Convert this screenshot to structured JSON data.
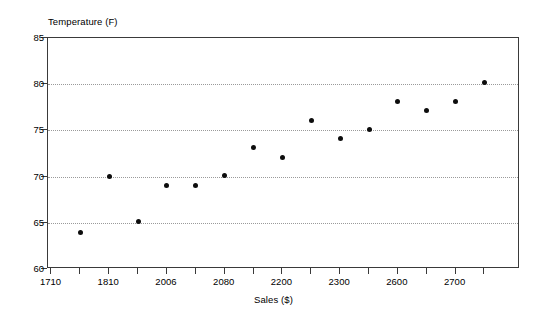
{
  "chart_data": {
    "type": "scatter",
    "title": "",
    "xlabel": "Sales ($)",
    "ylabel": "Temperature (F)",
    "ylim": [
      60,
      85
    ],
    "y_ticks": [
      60,
      65,
      70,
      75,
      80,
      85
    ],
    "grid": "horizontal-dotted",
    "legend": "none",
    "x_tick_labels": [
      "1710",
      "",
      "1810",
      "",
      "2006",
      "",
      "2080",
      "",
      "2200",
      "",
      "2300",
      "",
      "2600",
      "",
      "2700",
      ""
    ],
    "x_categories": [
      "1710",
      "1760",
      "1810",
      "1910",
      "2006",
      "2050",
      "2080",
      "2150",
      "2200",
      "2250",
      "2300",
      "2450",
      "2600",
      "2650",
      "2700"
    ],
    "points": [
      {
        "x_label": "1710",
        "x_index": 1,
        "y": 64.0
      },
      {
        "x_label": "1760",
        "x_index": 2,
        "y": 70.0
      },
      {
        "x_label": "1810",
        "x_index": 3,
        "y": 65.1
      },
      {
        "x_label": "1910",
        "x_index": 4,
        "y": 69.0
      },
      {
        "x_label": "2006",
        "x_index": 5,
        "y": 69.0
      },
      {
        "x_label": "2050",
        "x_index": 6,
        "y": 70.1
      },
      {
        "x_label": "2080",
        "x_index": 7,
        "y": 73.1
      },
      {
        "x_label": "2150",
        "x_index": 8,
        "y": 72.1
      },
      {
        "x_label": "2200",
        "x_index": 9,
        "y": 76.1
      },
      {
        "x_label": "2250",
        "x_index": 10,
        "y": 74.1
      },
      {
        "x_label": "2300",
        "x_index": 11,
        "y": 75.1
      },
      {
        "x_label": "2450",
        "x_index": 12,
        "y": 78.1
      },
      {
        "x_label": "2600",
        "x_index": 13,
        "y": 77.1
      },
      {
        "x_label": "2650",
        "x_index": 14,
        "y": 78.1
      },
      {
        "x_label": "2700",
        "x_index": 15,
        "y": 80.2
      }
    ],
    "marker_color": "#0d0d0d",
    "axis_color": "#3a3a3a",
    "grid_color": "#9a9a9a",
    "background_color": "#ffffff"
  }
}
